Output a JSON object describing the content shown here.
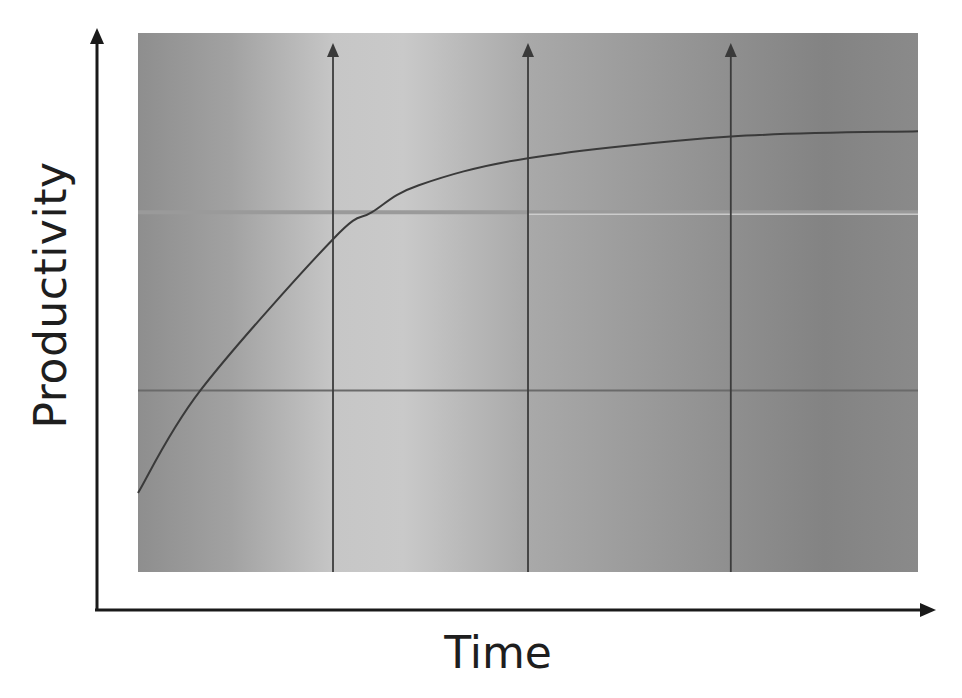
{
  "chart_data": {
    "type": "line",
    "title": "",
    "xlabel": "Time",
    "ylabel": "Productivity",
    "x_ticks": [],
    "y_ticks": [],
    "grid": false,
    "legend": null,
    "xlim": [
      0,
      100
    ],
    "ylim": [
      0,
      100
    ],
    "series": [
      {
        "name": "Productivity curve",
        "x": [
          0,
          8,
          25,
          30,
          36,
          50,
          76,
          100
        ],
        "y": [
          15,
          34,
          62,
          67,
          72,
          77,
          81,
          82
        ]
      }
    ],
    "reference_lines": {
      "vertical": [
        {
          "x": 25,
          "style": "arrow-up"
        },
        {
          "x": 50,
          "style": "arrow-up"
        },
        {
          "x": 76,
          "style": "arrow-up"
        }
      ],
      "horizontal": [
        {
          "y": 67
        },
        {
          "y": 34
        }
      ]
    },
    "background": "grey gradient panel (lighter near x≈25–35, darker toward right)"
  },
  "colors": {
    "axis": "#1a1a1a",
    "curve": "#3a3a3a",
    "panel_dark": "#8c8c8c",
    "panel_light": "#c9c9c9",
    "panel_right": "#7f7f7f",
    "vline": "#3c3c3c",
    "hline_upper": "#9a9a9a",
    "hline_upper_right": "#d8d8d8",
    "hline_lower": "#6a6a6a",
    "text": "#1e1e1e"
  }
}
